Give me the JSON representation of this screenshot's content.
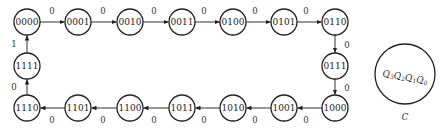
{
  "diagram": {
    "type": "state-transition",
    "node_radius": 13,
    "nodes": [
      {
        "id": "0000",
        "label": "0000",
        "x": 27,
        "y": 22
      },
      {
        "id": "0001",
        "label": "0001",
        "x": 78,
        "y": 22
      },
      {
        "id": "0010",
        "label": "0010",
        "x": 130,
        "y": 22
      },
      {
        "id": "0011",
        "label": "0011",
        "x": 182,
        "y": 22
      },
      {
        "id": "0100",
        "label": "0100",
        "x": 233,
        "y": 22
      },
      {
        "id": "0101",
        "label": "0101",
        "x": 284,
        "y": 22
      },
      {
        "id": "0110",
        "label": "0110",
        "x": 335,
        "y": 22
      },
      {
        "id": "0111",
        "label": "0111",
        "x": 335,
        "y": 66
      },
      {
        "id": "1000",
        "label": "1000",
        "x": 335,
        "y": 108
      },
      {
        "id": "1001",
        "label": "1001",
        "x": 284,
        "y": 108
      },
      {
        "id": "1010",
        "label": "1010",
        "x": 233,
        "y": 108
      },
      {
        "id": "1011",
        "label": "1011",
        "x": 182,
        "y": 108
      },
      {
        "id": "1100",
        "label": "1100",
        "x": 130,
        "y": 108
      },
      {
        "id": "1101",
        "label": "1101",
        "x": 78,
        "y": 108
      },
      {
        "id": "1110",
        "label": "1110",
        "x": 27,
        "y": 108
      },
      {
        "id": "1111",
        "label": "1111",
        "x": 27,
        "y": 66
      }
    ],
    "edges": [
      {
        "from": "0000",
        "to": "0001",
        "label": "0",
        "lx": 52,
        "ly": 11
      },
      {
        "from": "0001",
        "to": "0010",
        "label": "0",
        "lx": 103,
        "ly": 11
      },
      {
        "from": "0010",
        "to": "0011",
        "label": "0",
        "lx": 154,
        "ly": 11
      },
      {
        "from": "0011",
        "to": "0100",
        "label": "0",
        "lx": 204,
        "ly": 11
      },
      {
        "from": "0100",
        "to": "0101",
        "label": "0",
        "lx": 255,
        "ly": 11
      },
      {
        "from": "0101",
        "to": "0110",
        "label": "0",
        "lx": 306,
        "ly": 11
      },
      {
        "from": "0110",
        "to": "0111",
        "label": "0",
        "lx": 347,
        "ly": 45
      },
      {
        "from": "0111",
        "to": "1000",
        "label": "0",
        "lx": 347,
        "ly": 88
      },
      {
        "from": "1000",
        "to": "1001",
        "label": "0",
        "lx": 306,
        "ly": 120
      },
      {
        "from": "1001",
        "to": "1010",
        "label": "0",
        "lx": 255,
        "ly": 120
      },
      {
        "from": "1010",
        "to": "1011",
        "label": "0",
        "lx": 204,
        "ly": 120
      },
      {
        "from": "1011",
        "to": "1100",
        "label": "0",
        "lx": 154,
        "ly": 120
      },
      {
        "from": "1100",
        "to": "1101",
        "label": "0",
        "lx": 103,
        "ly": 120
      },
      {
        "from": "1101",
        "to": "1110",
        "label": "0",
        "lx": 52,
        "ly": 120
      },
      {
        "from": "1110",
        "to": "1111",
        "label": "0",
        "lx": 14,
        "ly": 87
      },
      {
        "from": "1111",
        "to": "0000",
        "label": "1",
        "lx": 14,
        "ly": 44
      }
    ],
    "legend": {
      "x": 405,
      "y": 74,
      "r": 30,
      "state_text": "Q3Q2Q1Q0",
      "caption": "C",
      "caption_y": 117
    }
  }
}
